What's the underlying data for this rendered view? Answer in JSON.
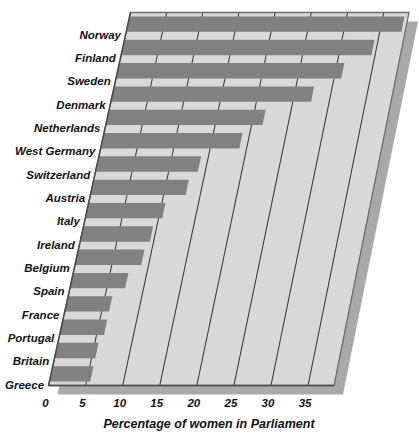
{
  "chart_data": {
    "type": "bar",
    "orientation": "horizontal",
    "title": "",
    "subtitle": "",
    "xlabel": "Percentage of women in Parliament",
    "ylabel": "",
    "xlim": [
      0,
      38.5
    ],
    "xticks": [
      0,
      5,
      10,
      15,
      20,
      25,
      30,
      35
    ],
    "xtick_labels": [
      "0",
      "5",
      "10",
      "15",
      "20",
      "25",
      "30",
      "35"
    ],
    "grid": true,
    "gridlines": "vertical",
    "legend": null,
    "legend_position": "none",
    "categories": [
      "Norway",
      "Finland",
      "Sweden",
      "Denmark",
      "Netherlands",
      "West Germany",
      "Switzerland",
      "Austria",
      "Italy",
      "Ireland",
      "Belgium",
      "Spain",
      "France",
      "Portugal",
      "Britain",
      "Greece"
    ],
    "values": [
      38,
      34.5,
      31,
      27.5,
      21.5,
      19,
      14,
      13,
      10.5,
      9.5,
      9,
      7.5,
      6,
      6,
      5.5,
      5.5
    ],
    "style": {
      "projection": "skewed-perspective",
      "bar_color": "#818181",
      "plot_background": "#d9d9d9",
      "gridline_color": "#3d3d3d",
      "frame_color": "#6e6e6e",
      "shadow_color": "#a9a9a9",
      "page_background": "#ffffff",
      "text_color": "#111111"
    }
  }
}
